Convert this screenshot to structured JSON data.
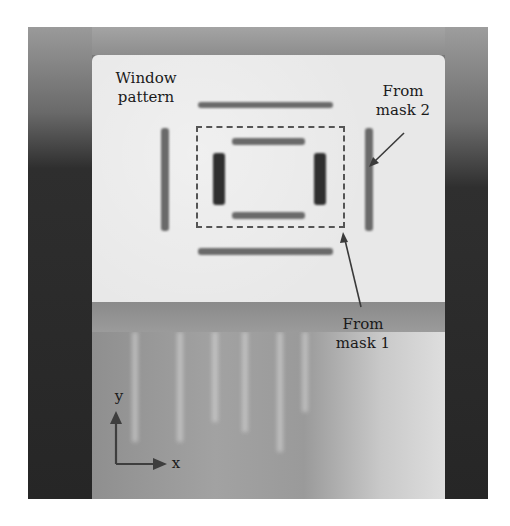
{
  "figure": {
    "annotations": {
      "window_pattern": {
        "line1": "Window",
        "line2": "pattern"
      },
      "mask2": {
        "line1": "From",
        "line2": "mask 2"
      },
      "mask1": {
        "line1": "From",
        "line2": "mask 1"
      }
    },
    "axes": {
      "y_label": "y",
      "x_label": "x"
    },
    "colors": {
      "light_panel": "#e8e8e8",
      "dark_band": "#262626",
      "mark": "#555555",
      "text": "#1a1a1a"
    }
  }
}
